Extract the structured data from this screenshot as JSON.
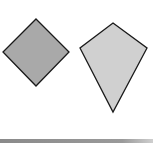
{
  "figure": {
    "shapes": [
      {
        "name": "rotated-square",
        "type": "polygon",
        "points": "36,19 69,52 36,86 3,52",
        "fill": "#a9a9a9",
        "stroke": "#1a1a1a"
      },
      {
        "name": "kite",
        "type": "polygon",
        "points": "113,23 147,48 113,112 80,48",
        "fill": "#d0d0d0",
        "stroke": "#1a1a1a"
      }
    ],
    "bottom_rule_color": "#8f8f8f"
  }
}
